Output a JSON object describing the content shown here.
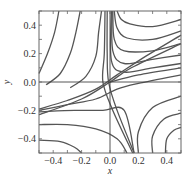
{
  "chart_data": {
    "type": "line",
    "title": "",
    "subtitle": "",
    "xlabel": "x",
    "ylabel": "y",
    "xlim": [
      -0.5,
      0.5
    ],
    "ylim": [
      -0.5,
      0.5
    ],
    "grid": false,
    "legend": null,
    "xticks": [
      -0.4,
      -0.2,
      0.0,
      0.2,
      0.4
    ],
    "yticks": [
      -0.4,
      -0.2,
      0.0,
      0.2,
      0.4
    ],
    "xtick_labels": [
      "−0.4",
      "−0.2",
      "0.0",
      "0.2",
      "0.4"
    ],
    "ytick_labels": [
      "−0.4",
      "−0.2",
      "0.0",
      "0.2",
      "0.4"
    ],
    "colors": {
      "curve": "#555555",
      "frame": "#666666",
      "reference": "#444444"
    },
    "series": [
      {
        "name": "traj-ul-1",
        "points": [
          [
            -0.5,
            0.06
          ],
          [
            -0.44,
            0.2
          ],
          [
            -0.39,
            0.35
          ],
          [
            -0.36,
            0.5
          ]
        ]
      },
      {
        "name": "traj-ul-2",
        "points": [
          [
            -0.45,
            -0.02
          ],
          [
            -0.35,
            0.06
          ],
          [
            -0.28,
            0.2
          ],
          [
            -0.24,
            0.35
          ],
          [
            -0.21,
            0.5
          ]
        ]
      },
      {
        "name": "traj-ul-3",
        "points": [
          [
            -0.28,
            -0.04
          ],
          [
            -0.17,
            0.04
          ],
          [
            -0.1,
            0.18
          ],
          [
            -0.08,
            0.35
          ],
          [
            -0.06,
            0.5
          ]
        ]
      },
      {
        "name": "traj-ur-1",
        "points": [
          [
            0.05,
            0.5
          ],
          [
            0.08,
            0.44
          ],
          [
            0.14,
            0.41
          ],
          [
            0.3,
            0.39
          ],
          [
            0.5,
            0.44
          ]
        ]
      },
      {
        "name": "traj-ur-2",
        "points": [
          [
            0.03,
            0.5
          ],
          [
            0.05,
            0.38
          ],
          [
            0.12,
            0.31
          ],
          [
            0.3,
            0.3
          ],
          [
            0.5,
            0.36
          ]
        ]
      },
      {
        "name": "traj-ur-3",
        "points": [
          [
            0.02,
            0.5
          ],
          [
            0.03,
            0.3
          ],
          [
            0.1,
            0.22
          ],
          [
            0.3,
            0.22
          ],
          [
            0.5,
            0.27
          ]
        ]
      },
      {
        "name": "traj-ur-4",
        "points": [
          [
            0.015,
            0.5
          ],
          [
            0.02,
            0.22
          ],
          [
            0.1,
            0.13
          ],
          [
            0.3,
            0.16
          ],
          [
            0.5,
            0.19
          ]
        ]
      },
      {
        "name": "traj-ur-5",
        "points": [
          [
            0.01,
            0.5
          ],
          [
            0.01,
            0.15
          ],
          [
            0.1,
            0.07
          ],
          [
            0.3,
            0.1
          ],
          [
            0.5,
            0.13
          ]
        ]
      },
      {
        "name": "traj-ur-6",
        "points": [
          [
            0.0,
            0.0
          ],
          [
            0.2,
            0.05
          ],
          [
            0.5,
            0.1
          ]
        ]
      },
      {
        "name": "separatrix-diag",
        "points": [
          [
            -0.5,
            -0.23
          ],
          [
            -0.2,
            -0.12
          ],
          [
            0.0,
            0.0
          ],
          [
            0.15,
            0.1
          ],
          [
            0.5,
            0.27
          ]
        ]
      },
      {
        "name": "traj-v-1",
        "points": [
          [
            -0.02,
            0.5
          ],
          [
            -0.02,
            0.2
          ],
          [
            -0.01,
            0.0
          ],
          [
            0.05,
            -0.2
          ],
          [
            0.17,
            -0.5
          ]
        ]
      },
      {
        "name": "traj-v-2",
        "points": [
          [
            -0.035,
            0.5
          ],
          [
            -0.04,
            0.2
          ],
          [
            -0.05,
            0.0
          ],
          [
            0.02,
            -0.2
          ],
          [
            0.16,
            -0.5
          ]
        ]
      },
      {
        "name": "traj-l-1",
        "points": [
          [
            -0.5,
            -0.19
          ],
          [
            -0.3,
            -0.13
          ],
          [
            -0.1,
            -0.05
          ],
          [
            0.05,
            0.05
          ],
          [
            0.25,
            0.18
          ],
          [
            0.5,
            0.33
          ]
        ]
      },
      {
        "name": "traj-l-2",
        "points": [
          [
            -0.5,
            -0.2
          ],
          [
            -0.3,
            -0.16
          ],
          [
            -0.1,
            -0.12
          ],
          [
            0.05,
            -0.05
          ],
          [
            0.2,
            -0.01
          ],
          [
            0.5,
            0.05
          ]
        ]
      },
      {
        "name": "traj-l-3",
        "points": [
          [
            -0.5,
            -0.21
          ],
          [
            -0.25,
            -0.2
          ],
          [
            -0.05,
            -0.2
          ],
          [
            0.1,
            -0.2
          ],
          [
            0.17,
            -0.5
          ]
        ]
      },
      {
        "name": "traj-l-4",
        "points": [
          [
            -0.5,
            -0.3
          ],
          [
            -0.3,
            -0.3
          ],
          [
            -0.1,
            -0.33
          ],
          [
            0.05,
            -0.4
          ],
          [
            0.12,
            -0.5
          ]
        ]
      },
      {
        "name": "traj-l-5",
        "points": [
          [
            -0.5,
            -0.41
          ],
          [
            -0.35,
            -0.42
          ],
          [
            -0.25,
            -0.46
          ],
          [
            -0.2,
            -0.5
          ]
        ]
      },
      {
        "name": "traj-lr-1",
        "points": [
          [
            0.2,
            -0.5
          ],
          [
            0.2,
            -0.35
          ],
          [
            0.3,
            -0.18
          ],
          [
            0.5,
            -0.1
          ]
        ]
      },
      {
        "name": "traj-lr-2",
        "points": [
          [
            0.3,
            -0.5
          ],
          [
            0.3,
            -0.38
          ],
          [
            0.38,
            -0.26
          ],
          [
            0.5,
            -0.22
          ]
        ]
      },
      {
        "name": "traj-lr-3",
        "points": [
          [
            0.39,
            -0.5
          ],
          [
            0.4,
            -0.4
          ],
          [
            0.45,
            -0.34
          ],
          [
            0.5,
            -0.32
          ]
        ]
      }
    ]
  }
}
